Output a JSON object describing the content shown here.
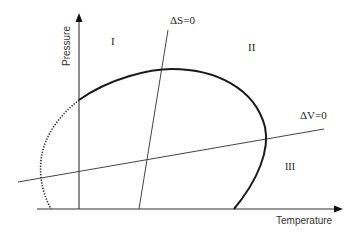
{
  "diagram": {
    "axes": {
      "x_label": "Temperature",
      "y_label": "Pressure"
    },
    "lines": {
      "entropy_line_label": "ΔS=0",
      "volume_line_label": "ΔV=0"
    },
    "regions": {
      "region_1": "I",
      "region_2": "II",
      "region_3": "III"
    },
    "colors": {
      "axis": "#333333",
      "curve": "#1a1a1a",
      "line": "#444444"
    }
  }
}
